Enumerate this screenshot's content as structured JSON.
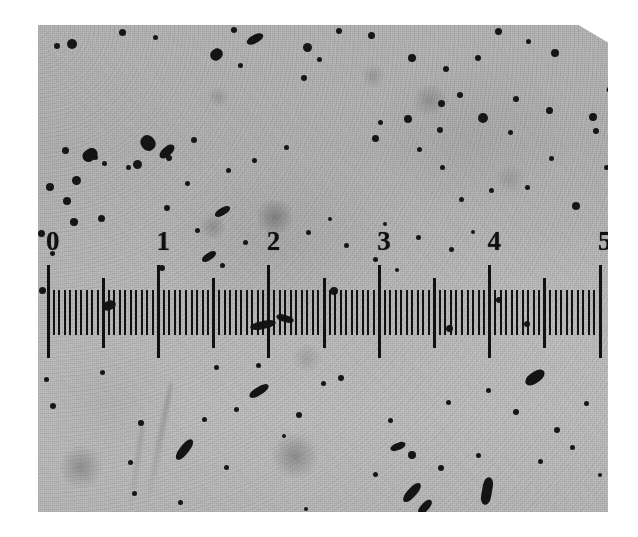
{
  "image": {
    "kind": "photomicrograph",
    "subject": "scale-bar-with-particles",
    "plate_color": "#b9b9b9",
    "ink_color": "#111111",
    "paper_color": "#ffffff",
    "caption": ""
  },
  "scale": {
    "type": "linear-ruler",
    "orientation": "horizontal",
    "labels": [
      "0",
      "1",
      "2",
      "3",
      "4",
      "5"
    ],
    "label_values": [
      0,
      1,
      2,
      3,
      4,
      5
    ],
    "range": [
      0,
      5
    ],
    "major_tick_interval": 1,
    "medium_tick_interval": 0.5,
    "minor_tick_interval": 0.05,
    "minor_ticks_per_unit": 20,
    "units_shown": ""
  },
  "chart_data": {
    "type": "table",
    "title": "",
    "xlabel": "",
    "ylabel": "",
    "categories": [
      "0",
      "1",
      "2",
      "3",
      "4",
      "5"
    ],
    "values": [
      0,
      1,
      2,
      3,
      4,
      5
    ],
    "axis_range": [
      0,
      5
    ],
    "grid": false,
    "legend": "none",
    "annotation": "Horizontal graduated scale spanning 0 to 5 with 20 minor subdivisions per major unit, photographed against a grainy gray field containing dark particulate inclusions."
  },
  "particles": {
    "description": "dark opaque dots and elongated rod-shaped inclusions scattered over the gray field",
    "dot_count_estimate": 118,
    "rod_count_estimate": 18,
    "blur_count_estimate": 9
  }
}
